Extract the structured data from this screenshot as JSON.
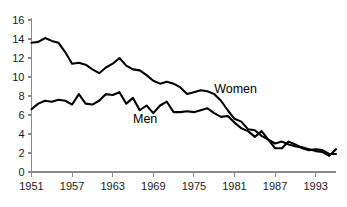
{
  "chart_data": {
    "type": "line",
    "title": "",
    "subtitle": "",
    "xlabel": "",
    "ylabel": "",
    "xlim": [
      1951,
      1996
    ],
    "ylim": [
      0,
      16
    ],
    "grid": false,
    "legend_position": "inline-annotation",
    "y_ticks": [
      0,
      2,
      4,
      6,
      8,
      10,
      12,
      14,
      16
    ],
    "y_tick_labels": [
      "0",
      "2",
      "4",
      "6",
      "8",
      "10",
      "12",
      "14",
      "16"
    ],
    "x_ticks": [
      1951,
      1957,
      1963,
      1969,
      1975,
      1981,
      1987,
      1993
    ],
    "x_tick_labels": [
      "1951",
      "1957",
      "1963",
      "1969",
      "1975",
      "1981",
      "1987",
      "1993"
    ],
    "x": [
      1951,
      1952,
      1953,
      1954,
      1955,
      1956,
      1957,
      1958,
      1959,
      1960,
      1961,
      1962,
      1963,
      1964,
      1965,
      1966,
      1967,
      1968,
      1969,
      1970,
      1971,
      1972,
      1973,
      1974,
      1975,
      1976,
      1977,
      1978,
      1979,
      1980,
      1981,
      1982,
      1983,
      1984,
      1985,
      1986,
      1987,
      1988,
      1989,
      1990,
      1991,
      1992,
      1993,
      1994,
      1995,
      1996
    ],
    "series": [
      {
        "name": "Women",
        "color": "#000000",
        "annotation": "Women",
        "annotation_x": 1978,
        "annotation_y": 8.3,
        "values": [
          13.6,
          13.7,
          14.1,
          13.8,
          13.6,
          12.6,
          11.4,
          11.5,
          11.3,
          10.8,
          10.4,
          11.0,
          11.4,
          12.0,
          11.2,
          10.8,
          10.7,
          10.2,
          9.6,
          9.3,
          9.5,
          9.3,
          8.9,
          8.2,
          8.4,
          8.6,
          8.5,
          8.2,
          7.5,
          6.5,
          5.6,
          5.3,
          4.5,
          4.4,
          3.8,
          3.4,
          3.0,
          3.2,
          2.9,
          2.7,
          2.6,
          2.4,
          2.2,
          2.1,
          1.7,
          2.4
        ]
      },
      {
        "name": "Men",
        "color": "#000000",
        "annotation": "Men",
        "annotation_x": 1966,
        "annotation_y": 5.2,
        "values": [
          6.6,
          7.2,
          7.5,
          7.4,
          7.6,
          7.5,
          7.1,
          8.2,
          7.2,
          7.1,
          7.5,
          8.2,
          8.1,
          8.4,
          7.2,
          7.8,
          6.5,
          7.0,
          6.2,
          7.0,
          7.4,
          6.3,
          6.3,
          6.4,
          6.3,
          6.5,
          6.7,
          6.2,
          5.8,
          5.9,
          5.2,
          4.6,
          4.3,
          3.7,
          4.3,
          3.4,
          2.5,
          2.5,
          3.2,
          2.9,
          2.5,
          2.3,
          2.4,
          2.3,
          1.9,
          1.9
        ]
      }
    ]
  }
}
